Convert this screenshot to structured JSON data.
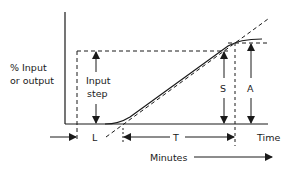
{
  "diagram": {
    "type": "process-reaction-curve",
    "y_axis_label_line1": "% Input",
    "y_axis_label_line2": "or output",
    "input_step_label_line1": "Input",
    "input_step_label_line2": "step",
    "dead_time_label": "L",
    "time_constant_label": "T",
    "slope_span_label": "S",
    "amplitude_label": "A",
    "x_axis_label": "Time",
    "minutes_label": "Minutes",
    "colors": {
      "line": "#1a1a1a",
      "background": "#ffffff"
    }
  }
}
